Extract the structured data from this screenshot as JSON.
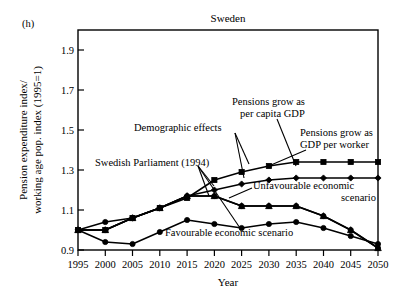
{
  "figure": {
    "panel_label": "(h)",
    "title": "Sweden"
  },
  "axes": {
    "x_title": "Year",
    "y_title_line1": "Pension expenditure index/",
    "y_title_line2": "working age pop. index (1995=1)",
    "y_ticklabels": [
      "0.9",
      "1.1",
      "1.3",
      "1.5",
      "1.7",
      "1.9"
    ],
    "x_ticklabels": [
      "1995",
      "2000",
      "2005",
      "2010",
      "2015",
      "2020",
      "2025",
      "2030",
      "2035",
      "2040",
      "2045",
      "2050"
    ]
  },
  "annotations": {
    "demographic": "Demographic effects",
    "parliament": "Swedish Parliament (1994)",
    "per_capita_l1": "Pensions grow as",
    "per_capita_l2": "per capita GDP",
    "per_worker_l1": "Pensions grow as",
    "per_worker_l2": "GDP per worker",
    "unfavourable_l1": "Unfavourable economic",
    "unfavourable_l2": "scenario",
    "favourable": "Favourable economic scenario"
  },
  "colors": {
    "ink": "#000000",
    "background": "#ffffff"
  },
  "chart_data": {
    "type": "line",
    "title": "Sweden",
    "xlabel": "Year",
    "ylabel": "Pension expenditure index/ working age pop. index (1995=1)",
    "xlim": [
      1995,
      2050
    ],
    "ylim": [
      0.9,
      2.0
    ],
    "yticks": [
      0.9,
      1.1,
      1.3,
      1.5,
      1.7,
      1.9
    ],
    "grid": false,
    "legend": "annotations on plot",
    "x": [
      1995,
      2000,
      2005,
      2010,
      2015,
      2020,
      2025,
      2030,
      2035,
      2040,
      2045,
      2050
    ],
    "series": [
      {
        "name": "Pensions grow as GDP per worker",
        "marker": "square",
        "values": [
          1.0,
          1.0,
          1.06,
          1.11,
          1.16,
          1.25,
          1.29,
          1.32,
          1.34,
          1.34,
          1.34,
          1.34
        ]
      },
      {
        "name": "Pensions grow as per capita GDP",
        "marker": "diamond",
        "values": [
          1.0,
          1.0,
          1.06,
          1.11,
          1.17,
          1.2,
          1.23,
          1.25,
          1.26,
          1.26,
          1.26,
          1.26
        ]
      },
      {
        "name": "Demographic effects",
        "marker": "triangle",
        "values": [
          1.0,
          1.0,
          1.06,
          1.11,
          1.17,
          1.17,
          1.12,
          1.12,
          1.12,
          1.07,
          1.0,
          0.91
        ]
      },
      {
        "name": "Swedish Parliament (1994) / Unfavourable economic scenario",
        "marker": "circle",
        "values": [
          1.0,
          1.04,
          1.06,
          1.11,
          1.17,
          1.17,
          1.12,
          1.12,
          1.12,
          1.07,
          1.0,
          0.91
        ]
      },
      {
        "name": "Favourable economic scenario",
        "marker": "circle",
        "values": [
          1.0,
          0.94,
          0.93,
          0.99,
          1.05,
          1.03,
          1.01,
          1.03,
          1.04,
          1.01,
          0.97,
          0.93
        ]
      }
    ]
  }
}
